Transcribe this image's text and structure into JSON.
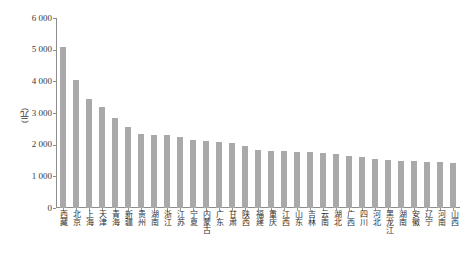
{
  "chart_data": {
    "type": "bar",
    "title": "",
    "xlabel": "",
    "ylabel": "(元)",
    "ylim": [
      0,
      6000
    ],
    "ytick_step": 1000,
    "ytick_labels": [
      "6 000",
      "5 000",
      "4 000",
      "3 000",
      "2 000",
      "1 000",
      "0"
    ],
    "ytick_values": [
      6000,
      5000,
      4000,
      3000,
      2000,
      1000,
      0
    ],
    "grid": false,
    "legend": null,
    "bar_color": "#a9a9a9",
    "axis_color": "#8d8d8d",
    "categories": [
      "西藏",
      "北京",
      "上海",
      "天津",
      "青海",
      "新疆",
      "贵州",
      "湖南",
      "浙江",
      "江苏",
      "宁夏",
      "内蒙古",
      "广东",
      "甘肃",
      "陕西",
      "福建",
      "重庆",
      "江西",
      "山东",
      "吉林",
      "云南",
      "湖北",
      "广西",
      "四川",
      "河北",
      "黑龙江",
      "湖南",
      "安徽",
      "辽宁",
      "河南",
      "山西"
    ],
    "values": [
      5100,
      4050,
      3450,
      3200,
      2850,
      2550,
      2350,
      2300,
      2300,
      2250,
      2150,
      2130,
      2100,
      2050,
      1950,
      1830,
      1800,
      1790,
      1780,
      1770,
      1750,
      1700,
      1650,
      1600,
      1560,
      1530,
      1500,
      1480,
      1450,
      1440,
      1430
    ]
  }
}
